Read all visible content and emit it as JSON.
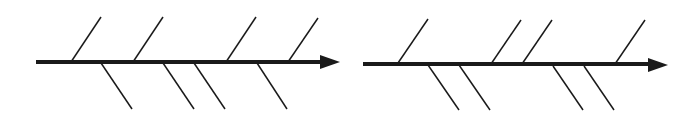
{
  "diagrams": [
    {
      "name": "fishbone-left",
      "spine": {
        "x1": 36,
        "x2": 322,
        "y": 62
      },
      "arrowhead": {
        "tip_x": 340,
        "base_x": 320,
        "y": 62,
        "half_h": 7
      },
      "upper_bones": [
        {
          "x1": 71,
          "y1": 62,
          "x2": 101,
          "y2": 17
        },
        {
          "x1": 133,
          "y1": 62,
          "x2": 163,
          "y2": 17
        },
        {
          "x1": 226,
          "y1": 62,
          "x2": 256,
          "y2": 17
        },
        {
          "x1": 288,
          "y1": 62,
          "x2": 318,
          "y2": 18
        }
      ],
      "lower_bones": [
        {
          "x1": 101,
          "y1": 63,
          "x2": 132,
          "y2": 109
        },
        {
          "x1": 163,
          "y1": 63,
          "x2": 194,
          "y2": 109
        },
        {
          "x1": 194,
          "y1": 63,
          "x2": 225,
          "y2": 109
        },
        {
          "x1": 257,
          "y1": 63,
          "x2": 287,
          "y2": 109
        }
      ]
    },
    {
      "name": "fishbone-right",
      "spine": {
        "x1": 363,
        "x2": 650,
        "y": 64
      },
      "arrowhead": {
        "tip_x": 668,
        "base_x": 648,
        "y": 65,
        "half_h": 7
      },
      "upper_bones": [
        {
          "x1": 398,
          "y1": 63,
          "x2": 428,
          "y2": 19
        },
        {
          "x1": 491,
          "y1": 64,
          "x2": 521,
          "y2": 20
        },
        {
          "x1": 522,
          "y1": 64,
          "x2": 552,
          "y2": 20
        },
        {
          "x1": 615,
          "y1": 64,
          "x2": 645,
          "y2": 20
        }
      ],
      "lower_bones": [
        {
          "x1": 428,
          "y1": 65,
          "x2": 459,
          "y2": 110
        },
        {
          "x1": 459,
          "y1": 65,
          "x2": 490,
          "y2": 110
        },
        {
          "x1": 553,
          "y1": 66,
          "x2": 583,
          "y2": 110
        },
        {
          "x1": 584,
          "y1": 66,
          "x2": 614,
          "y2": 110
        }
      ]
    }
  ],
  "colors": {
    "line": "#1a1a1a",
    "background": "#ffffff"
  }
}
